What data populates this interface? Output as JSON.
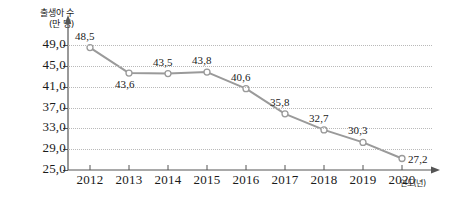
{
  "chart_data": {
    "type": "line",
    "title": "",
    "ylabel": "출생아 수\n(만 명)",
    "xlabel": "연도(년)",
    "categories": [
      "2012",
      "2013",
      "2014",
      "2015",
      "2016",
      "2017",
      "2018",
      "2019",
      "2020"
    ],
    "values": [
      48.5,
      43.6,
      43.5,
      43.8,
      40.6,
      35.8,
      32.7,
      30.3,
      27.2
    ],
    "value_labels": [
      "48,5",
      "43,6",
      "43,5",
      "43,8",
      "40,6",
      "35,8",
      "32,7",
      "30,3",
      "27,2"
    ],
    "label_positions": [
      "above",
      "below",
      "above",
      "above",
      "above",
      "above",
      "above",
      "above",
      "right"
    ],
    "ylim": [
      25.0,
      51.0
    ],
    "y_ticks": [
      25.0,
      29.0,
      33.0,
      37.0,
      41.0,
      45.0,
      49.0
    ],
    "y_tick_labels": [
      "25,0",
      "29,0",
      "33,0",
      "37,0",
      "41,0",
      "45,0",
      "49,0"
    ],
    "grid": true,
    "legend": "none",
    "series_color": "#9a9a9a",
    "marker": "open-circle",
    "marker_fill": "#ffffff",
    "axis_color": "#555555",
    "grid_color": "#b9b9b9",
    "text_color": "#1a1a1a"
  }
}
